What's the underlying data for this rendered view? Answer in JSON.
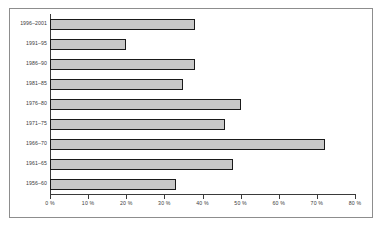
{
  "chart_data": {
    "type": "bar",
    "orientation": "horizontal",
    "title": "",
    "xlabel": "",
    "ylabel": "",
    "categories": [
      "1996–2001",
      "1991–95",
      "1986–90",
      "1981–85",
      "1976–80",
      "1971–75",
      "1966–70",
      "1961–65",
      "1956–60"
    ],
    "values": [
      38,
      20,
      38,
      35,
      50,
      46,
      72,
      48,
      33
    ],
    "xlim": [
      0,
      80
    ],
    "xticks": [
      0,
      10,
      20,
      30,
      40,
      50,
      60,
      70,
      80
    ],
    "xtick_labels": [
      "0 %",
      "10 %",
      "20 %",
      "30 %",
      "40 %",
      "50 %",
      "60 %",
      "70 %",
      "80 %"
    ],
    "grid": false,
    "legend": null,
    "bar_fill_color": "#c8c8c8",
    "bar_edge_color": "#1a1a1a",
    "axis_color": "#3a3a3a",
    "frame_color": "#8d8d8d",
    "background_color": "#ffffff"
  }
}
